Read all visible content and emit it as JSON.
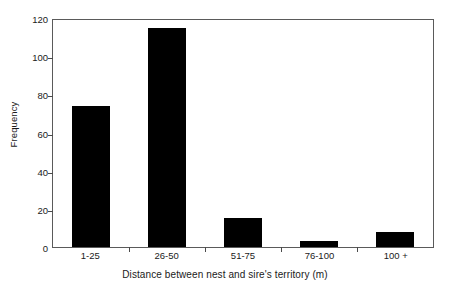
{
  "chart_data": {
    "type": "bar",
    "title": "",
    "subtitle": "",
    "xlabel": "Distance between nest and sire's territory (m)",
    "ylabel": "Frequency",
    "categories": [
      "1-25",
      "26-50",
      "51-75",
      "76-100",
      "100 +"
    ],
    "values": [
      74,
      115,
      15,
      3,
      8
    ],
    "ylim": [
      0,
      120
    ],
    "yticks": [
      0,
      20,
      40,
      60,
      80,
      100,
      120
    ],
    "ytick_labels": [
      "0",
      "20",
      "40",
      "60",
      "80",
      "100",
      "120"
    ],
    "xlim_categories": 5,
    "grid": false,
    "legend": null,
    "legend_position": "none",
    "annotations": [],
    "bar_color": "#000000",
    "axis_color": "#5a5a5a",
    "background_color": "#ffffff",
    "bar_width_fraction": 0.5
  }
}
